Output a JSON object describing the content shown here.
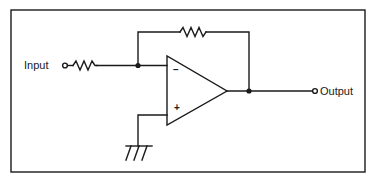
{
  "diagram": {
    "type": "inverting-amplifier-schematic",
    "labels": {
      "input": "Input",
      "output": "Output",
      "inverting_sign": "−",
      "non_inverting_sign": "+"
    },
    "components": [
      {
        "name": "input-resistor",
        "kind": "resistor"
      },
      {
        "name": "feedback-resistor",
        "kind": "resistor"
      },
      {
        "name": "op-amp",
        "kind": "operational-amplifier"
      },
      {
        "name": "ground",
        "kind": "ground"
      }
    ],
    "colors": {
      "stroke": "#1a1a1a",
      "background": "#ffffff"
    }
  }
}
